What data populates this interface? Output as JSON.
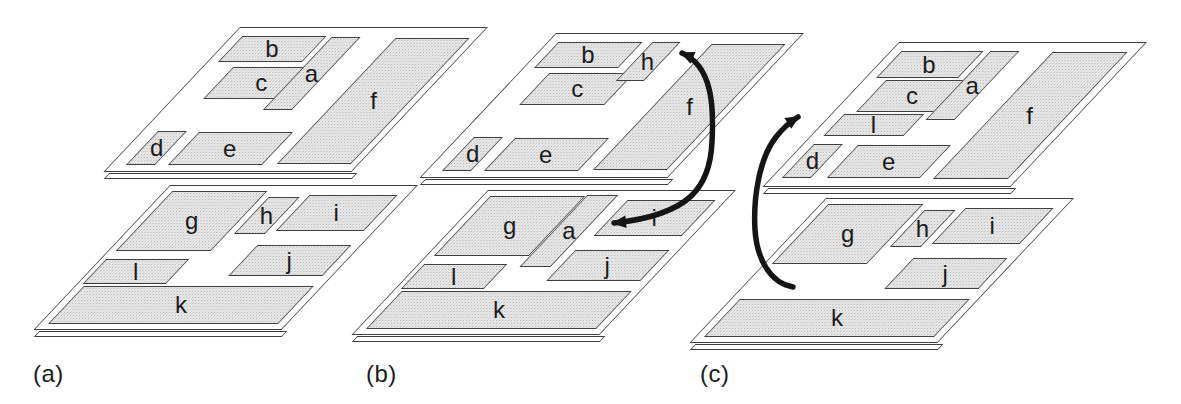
{
  "figure": {
    "colors": {
      "background": "#ffffff",
      "outline": "#3f3f3f",
      "block_fill": "#e9e9e9",
      "stipple": "#b3b3b3",
      "arrow": "#151515",
      "text": "#1b1b1b"
    },
    "plane_width": 248,
    "plane_height": 145
  },
  "panels": [
    {
      "id": "a",
      "label": "(a)",
      "label_x": 33,
      "label_y": 360,
      "planes": [
        {
          "name": "upper-layer",
          "x": 240,
          "y": 27,
          "blocks": [
            {
              "label": "b",
              "x": 10,
              "y": 8,
              "w": 84,
              "h": 26
            },
            {
              "label": "c",
              "x": 30,
              "y": 39,
              "w": 85,
              "h": 32
            },
            {
              "label": "a",
              "x": 100,
              "y": 9,
              "w": 29,
              "h": 73
            },
            {
              "label": "f",
              "x": 165,
              "y": 10,
              "w": 74,
              "h": 126
            },
            {
              "label": "d",
              "x": 15,
              "y": 103,
              "w": 29,
              "h": 34
            },
            {
              "label": "e",
              "x": 57,
              "y": 104,
              "w": 94,
              "h": 33
            }
          ]
        },
        {
          "name": "lower-layer",
          "x": 170,
          "y": 185,
          "blocks": [
            {
              "label": "g",
              "x": 7,
              "y": 5,
              "w": 95,
              "h": 60
            },
            {
              "label": "h",
              "x": 109,
              "y": 11,
              "w": 31,
              "h": 37
            },
            {
              "label": "i",
              "x": 148,
              "y": 9,
              "w": 88,
              "h": 36
            },
            {
              "label": "l",
              "x": 5,
              "y": 73,
              "w": 83,
              "h": 25
            },
            {
              "label": "j",
              "x": 143,
              "y": 59,
              "w": 94,
              "h": 31
            },
            {
              "label": "k",
              "x": 8,
              "y": 100,
              "w": 230,
              "h": 38
            }
          ]
        }
      ]
    },
    {
      "id": "b",
      "label": "(b)",
      "label_x": 366,
      "label_y": 360,
      "planes": [
        {
          "name": "upper-layer",
          "x": 556,
          "y": 33,
          "blocks": [
            {
              "label": "b",
              "x": 10,
              "y": 8,
              "w": 84,
              "h": 26
            },
            {
              "label": "c",
              "x": 30,
              "y": 39,
              "w": 85,
              "h": 32
            },
            {
              "label": "h",
              "x": 104,
              "y": 8,
              "w": 28,
              "h": 39
            },
            {
              "label": "f",
              "x": 165,
              "y": 10,
              "w": 74,
              "h": 126
            },
            {
              "label": "d",
              "x": 15,
              "y": 103,
              "w": 29,
              "h": 34
            },
            {
              "label": "e",
              "x": 57,
              "y": 104,
              "w": 94,
              "h": 33
            }
          ]
        },
        {
          "name": "lower-layer",
          "x": 488,
          "y": 190,
          "blocks": [
            {
              "label": "g",
              "x": 7,
              "y": 5,
              "w": 95,
              "h": 60
            },
            {
              "label": "a",
              "x": 103,
              "y": 4,
              "w": 31,
              "h": 72
            },
            {
              "label": "i",
              "x": 148,
              "y": 9,
              "w": 88,
              "h": 36
            },
            {
              "label": "l",
              "x": 5,
              "y": 73,
              "w": 83,
              "h": 25
            },
            {
              "label": "j",
              "x": 143,
              "y": 59,
              "w": 94,
              "h": 31
            },
            {
              "label": "k",
              "x": 8,
              "y": 100,
              "w": 230,
              "h": 38
            }
          ]
        }
      ]
    },
    {
      "id": "c",
      "label": "(c)",
      "label_x": 700,
      "label_y": 360,
      "planes": [
        {
          "name": "upper-layer",
          "x": 899,
          "y": 42,
          "blocks": [
            {
              "label": "b",
              "x": 10,
              "y": 8,
              "w": 82,
              "h": 27
            },
            {
              "label": "c",
              "x": 22,
              "y": 37,
              "w": 82,
              "h": 32
            },
            {
              "label": "a",
              "x": 99,
              "y": 8,
              "w": 29,
              "h": 69
            },
            {
              "label": "f",
              "x": 162,
              "y": 9,
              "w": 75,
              "h": 127
            },
            {
              "label": "l",
              "x": 12,
              "y": 71,
              "w": 80,
              "h": 22
            },
            {
              "label": "d",
              "x": 10,
              "y": 101,
              "w": 29,
              "h": 34
            },
            {
              "label": "e",
              "x": 55,
              "y": 102,
              "w": 93,
              "h": 33
            }
          ]
        },
        {
          "name": "lower-layer",
          "x": 826,
          "y": 198,
          "blocks": [
            {
              "label": "g",
              "x": 7,
              "y": 5,
              "w": 95,
              "h": 60
            },
            {
              "label": "h",
              "x": 109,
              "y": 11,
              "w": 31,
              "h": 37
            },
            {
              "label": "i",
              "x": 148,
              "y": 9,
              "w": 88,
              "h": 36
            },
            {
              "label": "j",
              "x": 143,
              "y": 59,
              "w": 94,
              "h": 31
            },
            {
              "label": "k",
              "x": 8,
              "y": 100,
              "w": 230,
              "h": 38
            }
          ]
        }
      ]
    }
  ],
  "arrows": [
    {
      "panel": "b",
      "meaning": "swap-blocks-h-and-a",
      "double": true,
      "path": "M 682 53 C 712 66 714 105 712 142 C 710 187 690 215 614 223"
    },
    {
      "panel": "c",
      "meaning": "move-block-l-to-upper-layer",
      "double": false,
      "path": "M 793 287 C 770 283 757 259 755 230 C 753 196 760 157 776 137 C 783 128 790 122 798 117"
    }
  ]
}
